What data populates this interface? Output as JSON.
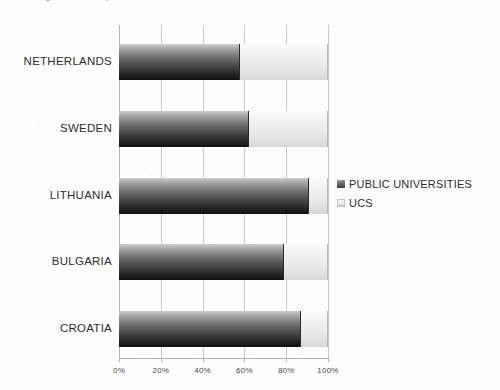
{
  "caption": {
    "text": "Figure: share of public universities and UCS in selected countries"
  },
  "chart_data": {
    "type": "bar",
    "subtype": "stacked-horizontal-100-percent",
    "title": "",
    "xlabel": "",
    "ylabel": "",
    "categories": [
      "NETHERLANDS",
      "SWEDEN",
      "LITHUANIA",
      "BULGARIA",
      "CROATIA"
    ],
    "series": [
      {
        "name": "PUBLIC UNIVERSITIES",
        "color": "#3a3a3a",
        "values": [
          58,
          62,
          91,
          79,
          87
        ]
      },
      {
        "name": "UCS",
        "color": "#ececec",
        "values": [
          42,
          38,
          9,
          21,
          13
        ]
      }
    ],
    "xlim": [
      0,
      100
    ],
    "xticks": [
      0,
      20,
      40,
      60,
      80,
      100
    ],
    "xtick_labels": [
      "0%",
      "20%",
      "40%",
      "60%",
      "80%",
      "100%"
    ],
    "grid": true,
    "grid_axis": "x",
    "legend_position": "right",
    "legend": [
      "PUBLIC UNIVERSITIES",
      "UCS"
    ]
  }
}
